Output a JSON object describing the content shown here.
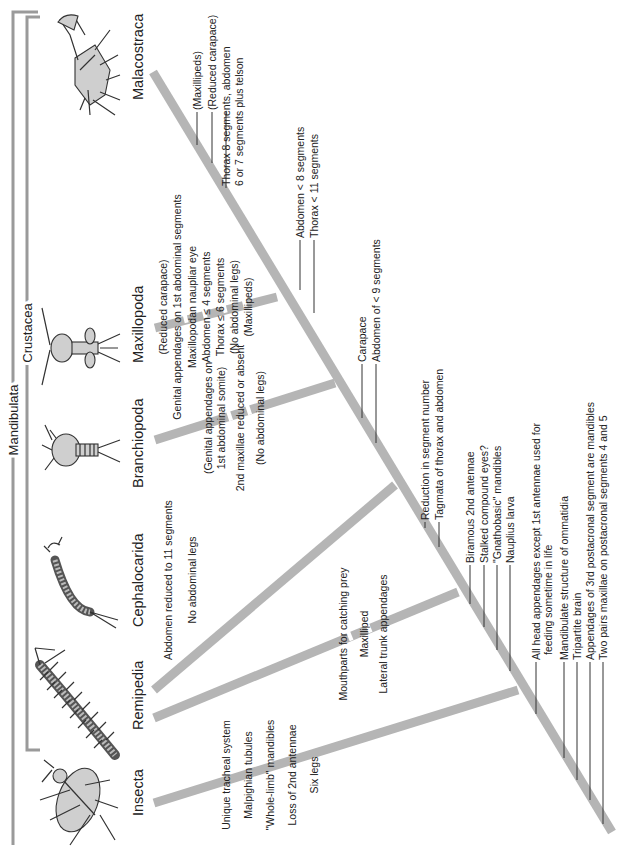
{
  "figure": {
    "orientation": "rotated-90-ccw",
    "colors": {
      "branch": "#b5b5b5",
      "bracket": "#9a9a9a",
      "text": "#222222"
    }
  },
  "groups": {
    "mandibulata": "Mandibulata",
    "crustacea": "Crustacea"
  },
  "taxa": [
    {
      "name": "Insecta",
      "icon": "beetle-icon"
    },
    {
      "name": "Remipedia",
      "icon": "remipede-icon"
    },
    {
      "name": "Cephalocarida",
      "icon": "cephalocarid-icon"
    },
    {
      "name": "Branchiopoda",
      "icon": "branchiopod-icon"
    },
    {
      "name": "Maxillopoda",
      "icon": "copepod-icon"
    },
    {
      "name": "Malacostraca",
      "icon": "crab-icon"
    }
  ],
  "characters": {
    "insecta": [
      "Unique tracheal system",
      "Malpighian tubules",
      "\"Whole-limb\" mandibles",
      "Loss of 2nd antennae",
      "Six legs"
    ],
    "remipedia": [
      "Mouthparts for catching prey",
      "Maxilliped",
      "Lateral trunk appendages"
    ],
    "cephalocarida": [
      "Abdomen reduced to 11 segments",
      "No abdominal legs"
    ],
    "branchiopoda": [
      "(Genital appendages on",
      "1st abdominal somite)",
      "2nd maxillae reduced or absent",
      "(No abdominal legs)"
    ],
    "maxillopoda": [
      "(Reduced carapace)",
      "Genital appendages on 1st abdominal segments",
      "Maxillopodan naupliar eye",
      "Abdomen ≤ 4 segments",
      "Thorax ≤ 6 segments",
      "(No abdominal legs)",
      "(Maxillipeds)"
    ],
    "malacostraca": [
      "(Maxillipeds)",
      "(Reduced carapace)",
      "Thorax 8 segments, abdomen",
      "6 or 7 segments plus telson"
    ],
    "node_maxillo_malaco": [
      "Abdomen < 8 segments",
      "Thorax < 11 segments"
    ],
    "node_branchio": [
      "Carapace",
      "Abdomen of < 9 segments"
    ],
    "node_cephalo": [
      "Reduction in segment number",
      "Tagmata of thorax and abdomen"
    ],
    "node_crustacea": [
      "Biramous 2nd antennae",
      "Stalked compound eyes?",
      "\"Gnathobasic\" mandibles",
      "Nauplius larva"
    ],
    "node_mandibulata": [
      "All head appendages except 1st antennae used for",
      "feeding sometime in life",
      "Mandibulate structure of ommatidia",
      "Tripartite brain",
      "Appendages of 3rd postacronal segment are mandibles",
      "Two pairs maxillae on postacronal segments 4 and 5"
    ]
  }
}
